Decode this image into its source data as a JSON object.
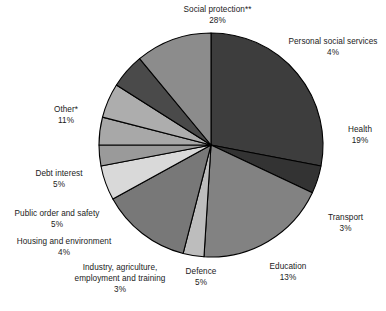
{
  "chart_data": {
    "type": "pie",
    "title": "",
    "subtitle": "",
    "xlabel": "",
    "ylabel": "",
    "legend_position": "none",
    "grid": false,
    "units": "percent",
    "total": 100,
    "categories": [
      "Social protection**",
      "Personal social services",
      "Health",
      "Transport",
      "Education",
      "Defence",
      "Industry, agriculture, employment and training",
      "Housing and environment",
      "Public order and safety",
      "Debt interest",
      "Other*"
    ],
    "values": [
      28,
      4,
      19,
      3,
      13,
      5,
      3,
      4,
      5,
      5,
      11
    ],
    "slices": [
      {
        "label": "Social protection**",
        "value": 28,
        "value_text": "28%",
        "color": "#3d3d3d",
        "label_lines": [
          "Social protection**",
          "28%"
        ],
        "label_x": 160,
        "label_y": 4,
        "label_align": "lbl-c",
        "label_w": 115
      },
      {
        "label": "Personal social services",
        "value": 4,
        "value_text": "4%",
        "color": "#333333",
        "label_lines": [
          "Personal social services",
          "4%"
        ],
        "label_x": 283,
        "label_y": 36,
        "label_align": "lbl-c",
        "label_w": 100
      },
      {
        "label": "Health",
        "value": 19,
        "value_text": "19%",
        "color": "#828282",
        "label_lines": [
          "Health",
          "19%"
        ],
        "label_x": 339,
        "label_y": 124,
        "label_align": "lbl-c",
        "label_w": 42
      },
      {
        "label": "Transport",
        "value": 3,
        "value_text": "3%",
        "color": "#bdbdbd",
        "label_lines": [
          "Transport",
          "3%"
        ],
        "label_x": 318,
        "label_y": 212,
        "label_align": "lbl-c",
        "label_w": 55
      },
      {
        "label": "Education",
        "value": 13,
        "value_text": "13%",
        "color": "#787878",
        "label_lines": [
          "Education",
          "13%"
        ],
        "label_x": 258,
        "label_y": 261,
        "label_align": "lbl-c",
        "label_w": 60
      },
      {
        "label": "Defence",
        "value": 5,
        "value_text": "5%",
        "color": "#d9d9d9",
        "label_lines": [
          "Defence",
          "5%"
        ],
        "label_x": 176,
        "label_y": 266,
        "label_align": "lbl-c",
        "label_w": 50
      },
      {
        "label": "Industry, agriculture, employment and training",
        "value": 3,
        "value_text": "3%",
        "color": "#9a9a9a",
        "label_lines": [
          "Industry, agriculture,",
          "employment and training",
          "3%"
        ],
        "label_x": 64,
        "label_y": 262,
        "label_align": "lbl-c",
        "label_w": 112
      },
      {
        "label": "Housing and environment",
        "value": 4,
        "value_text": "4%",
        "color": "#a8a8a8",
        "label_lines": [
          "Housing and environment",
          "4%"
        ],
        "label_x": 4,
        "label_y": 236,
        "label_align": "lbl-c",
        "label_w": 120
      },
      {
        "label": "Public order and safety",
        "value": 5,
        "value_text": "5%",
        "color": "#adadad",
        "label_lines": [
          "Public order and safety",
          "5%"
        ],
        "label_x": 2,
        "label_y": 208,
        "label_align": "lbl-c",
        "label_w": 110
      },
      {
        "label": "Debt interest",
        "value": 5,
        "value_text": "5%",
        "color": "#4a4a4a",
        "label_lines": [
          "Debt interest",
          "5%"
        ],
        "label_x": 24,
        "label_y": 168,
        "label_align": "lbl-c",
        "label_w": 70
      },
      {
        "label": "Other*",
        "value": 11,
        "value_text": "11%",
        "color": "#8c8c8c",
        "label_lines": [
          "Other*",
          "11%"
        ],
        "label_x": 44,
        "label_y": 104,
        "label_align": "lbl-c",
        "label_w": 44
      }
    ],
    "geometry": {
      "cx": 211,
      "cy": 145,
      "r": 112,
      "start_angle_deg": -90,
      "direction": "clockwise"
    },
    "colors": {
      "stroke": "#000000",
      "background": "#ffffff",
      "text": "#1a1a1a"
    }
  }
}
